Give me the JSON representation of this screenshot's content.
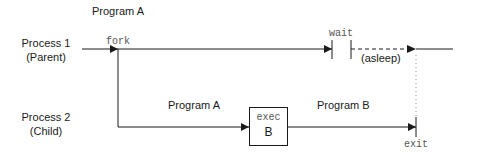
{
  "diagram": {
    "title": "Program A",
    "processes": [
      {
        "name": "Process 1",
        "role": "(Parent)"
      },
      {
        "name": "Process 2",
        "role": "(Child)"
      }
    ],
    "calls": {
      "fork": "fork",
      "wait": "wait",
      "exec": "exec",
      "exec_target": "B",
      "exit": "exit"
    },
    "states": {
      "asleep": "(asleep)"
    },
    "segments": {
      "child_before_exec": "Program A",
      "child_after_exec": "Program B"
    },
    "colors": {
      "line": "#1a1a1a",
      "text": "#1a1a1a",
      "mono_text": "#555555",
      "dotted": "#999999"
    }
  }
}
